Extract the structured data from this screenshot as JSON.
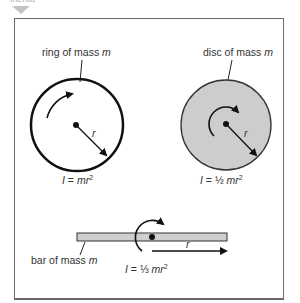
{
  "header": {
    "label": "Inertia"
  },
  "diagram": {
    "ring": {
      "label": "ring of mass ",
      "mass_symbol": "m",
      "radius_label": "r",
      "formula_prefix": "I",
      "formula_eq": " = ",
      "formula_body": "mr",
      "formula_exp": "2"
    },
    "disc": {
      "label": "disc of mass ",
      "mass_symbol": "m",
      "radius_label": "r",
      "formula_prefix": "I",
      "formula_eq": " = ½ ",
      "formula_body": "mr",
      "formula_exp": "2",
      "fill_color": "#cdcdcd"
    },
    "bar": {
      "label": "bar of mass ",
      "mass_symbol": "m",
      "radius_label": "r",
      "formula_prefix": "I",
      "formula_eq": " = ⅓ ",
      "formula_body": "mr",
      "formula_exp": "2",
      "fill_color": "#cfcfcf"
    }
  }
}
